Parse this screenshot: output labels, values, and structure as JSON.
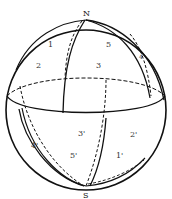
{
  "figure": {
    "type": "sphere-diagram",
    "poles": {
      "north": "N",
      "south": "S"
    },
    "upper_regions": [
      "1",
      "2",
      "3",
      "4",
      "5"
    ],
    "lower_regions": [
      "1'",
      "2'",
      "3'",
      "4'",
      "5'"
    ],
    "labels": {
      "N": "N",
      "S": "S",
      "r1": "1",
      "r2": "2",
      "r3": "3",
      "r4": "4",
      "r5": "5",
      "r1p": "1'",
      "r2p": "2'",
      "r3p": "3'",
      "r4p": "4'",
      "r5p": "5'"
    },
    "colors": {
      "stroke": "#111111",
      "background": "#ffffff",
      "label": "#333333"
    }
  }
}
